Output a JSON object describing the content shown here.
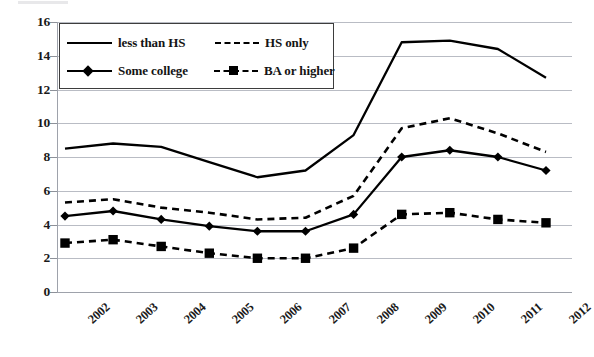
{
  "chart_data": {
    "type": "line",
    "title": "",
    "subtitle": "",
    "xlabel": "",
    "ylabel": "",
    "x": [
      "2002",
      "2003",
      "2004",
      "2005",
      "2006",
      "2007",
      "2008",
      "2009",
      "2010",
      "2011",
      "2012"
    ],
    "categories": [
      "2002",
      "2003",
      "2004",
      "2005",
      "2006",
      "2007",
      "2008",
      "2009",
      "2010",
      "2011",
      "2012"
    ],
    "ylim": [
      0,
      16
    ],
    "yticks": [
      0,
      2,
      4,
      6,
      8,
      10,
      12,
      14,
      16
    ],
    "grid": true,
    "legend_position": "top-left",
    "series": [
      {
        "name": "less than HS",
        "style": "solid",
        "marker": "none",
        "color": "#000000",
        "values": [
          8.5,
          8.8,
          8.6,
          7.7,
          6.8,
          7.2,
          9.3,
          14.8,
          14.9,
          14.4,
          12.7
        ]
      },
      {
        "name": "HS only",
        "style": "dashed",
        "marker": "none",
        "color": "#000000",
        "values": [
          5.3,
          5.5,
          5.0,
          4.7,
          4.3,
          4.4,
          5.7,
          9.7,
          10.3,
          9.4,
          8.3
        ]
      },
      {
        "name": "Some college",
        "style": "solid",
        "marker": "diamond",
        "color": "#000000",
        "values": [
          4.5,
          4.8,
          4.3,
          3.9,
          3.6,
          3.6,
          4.6,
          8.0,
          8.4,
          8.0,
          7.2
        ]
      },
      {
        "name": "BA or higher",
        "style": "dashed",
        "marker": "square",
        "color": "#000000",
        "values": [
          2.9,
          3.1,
          2.7,
          2.3,
          2.0,
          2.0,
          2.6,
          4.6,
          4.7,
          4.3,
          4.1
        ]
      }
    ]
  },
  "axes": {
    "y_tick_labels": [
      "16",
      "14",
      "12",
      "10",
      "8",
      "6",
      "4",
      "2",
      "0"
    ],
    "x_tick_labels": [
      "2002",
      "2003",
      "2004",
      "2005",
      "2006",
      "2007",
      "2008",
      "2009",
      "2010",
      "2011",
      "2012"
    ]
  },
  "legend": {
    "entries": [
      {
        "label": "less than HS",
        "swatch": "solid-line"
      },
      {
        "label": "HS only",
        "swatch": "dashed-line"
      },
      {
        "label": "Some college",
        "swatch": "solid-line-diamond-marker"
      },
      {
        "label": "BA or higher",
        "swatch": "dashed-line-square-marker"
      }
    ]
  },
  "colors": {
    "ink": "#000000",
    "gridline": "#b9bcc4",
    "axis": "#9ea2ab",
    "background": "#ffffff"
  }
}
